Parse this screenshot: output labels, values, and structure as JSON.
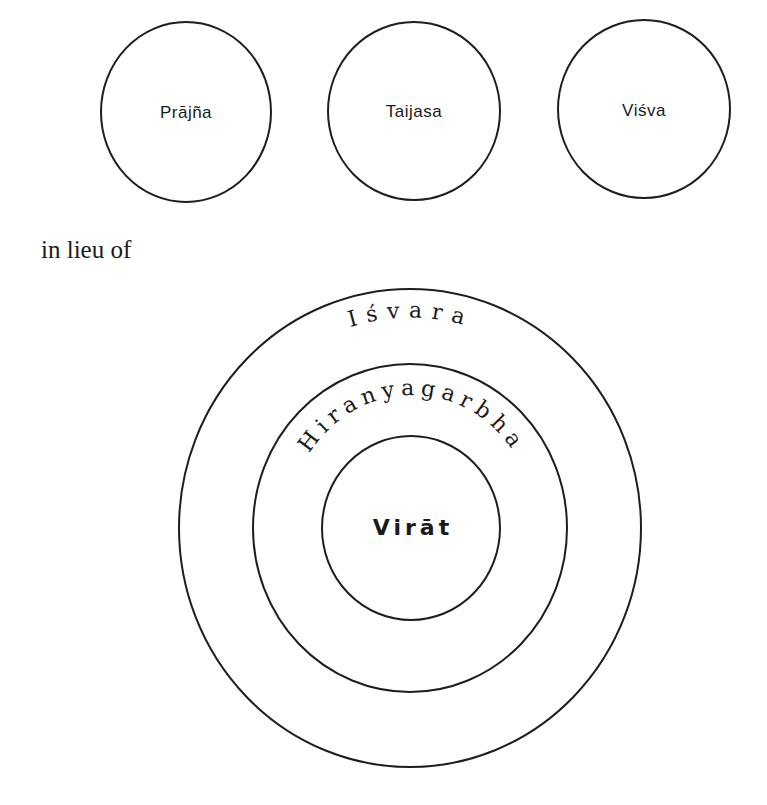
{
  "top_row": {
    "circles": [
      {
        "label": "Prājña"
      },
      {
        "label": "Taijasa"
      },
      {
        "label": "Viśva"
      }
    ]
  },
  "connector": {
    "text": "in lieu of"
  },
  "concentric": {
    "outer_label": "Iśvara",
    "middle_label": "Hiranyagarbha",
    "inner_label": "Virāt"
  },
  "colors": {
    "stroke": "#1e1e1e",
    "text": "#1a1a1a",
    "background": "#ffffff"
  }
}
